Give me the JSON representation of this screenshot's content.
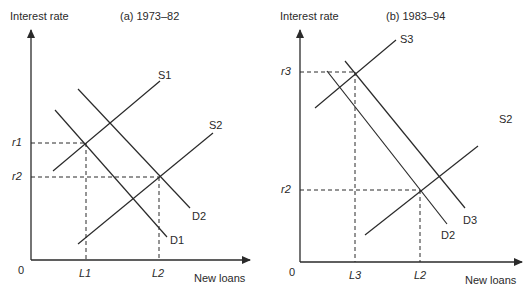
{
  "panels": [
    {
      "title": "(a) 1973–82",
      "y_axis_label": "Interest rate",
      "x_axis_label": "New loans",
      "origin_label": "0",
      "y_ticks": [
        "r1",
        "r2"
      ],
      "x_ticks": [
        "L1",
        "L2"
      ],
      "curves": {
        "supply": [
          "S1",
          "S2"
        ],
        "demand": [
          "D1",
          "D2"
        ]
      }
    },
    {
      "title": "(b) 1983–94",
      "y_axis_label": "Interest rate",
      "x_axis_label": "New loans",
      "origin_label": "0",
      "y_ticks": [
        "r3",
        "r2"
      ],
      "x_ticks": [
        "L3",
        "L2"
      ],
      "curves": {
        "supply": [
          "S3",
          "S2"
        ],
        "demand": [
          "D2",
          "D3"
        ]
      }
    }
  ],
  "colors": {
    "line": "#2a2a2a",
    "background": "#ffffff"
  }
}
